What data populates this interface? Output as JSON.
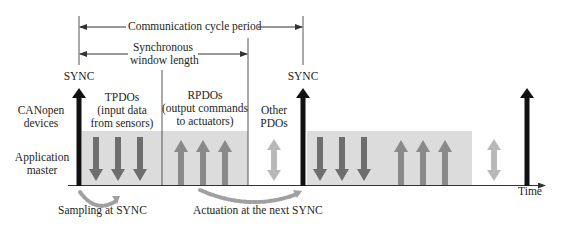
{
  "diagram": {
    "type": "timing-diagram",
    "colors": {
      "sync_arrow": "#111111",
      "window_box": "#dcdcdc",
      "tpdo_arrow": "#6e6e6e",
      "rpdo_arrow": "#8a8a8a",
      "other_pdo_arrow": "#b8b8b8",
      "dotted_curve": "#a0a0a0",
      "lines": "#333333"
    },
    "top_annotations": {
      "cycle_period": "Communication cycle period",
      "sync_window_line1": "Synchronous",
      "sync_window_line2": "window length"
    },
    "sync_labels": [
      "SYNC",
      "SYNC"
    ],
    "row_labels": {
      "devices_line1": "CANopen",
      "devices_line2": "devices",
      "master_line1": "Application",
      "master_line2": "master"
    },
    "phases": {
      "tpdo": {
        "line1": "TPDOs",
        "line2": "(input data",
        "line3": "from sensors)"
      },
      "rpdo": {
        "line1": "RPDOs",
        "line2": "(output commands",
        "line3": "to actuators)"
      },
      "other": {
        "line1": "Other",
        "line2": "PDOs"
      }
    },
    "axis_label": "Time",
    "bottom_annotations": {
      "sampling": "Sampling at SYNC",
      "actuation": "Actuation at the next SYNC"
    }
  }
}
